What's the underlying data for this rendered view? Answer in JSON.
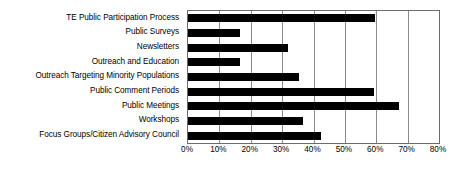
{
  "chart_data": {
    "type": "bar",
    "orientation": "horizontal",
    "title": "",
    "xlabel": "",
    "ylabel": "",
    "xlim": [
      0,
      80
    ],
    "xticks": [
      "0%",
      "10%",
      "20%",
      "30%",
      "40%",
      "50%",
      "60%",
      "70%",
      "80%"
    ],
    "xtick_values": [
      0,
      10,
      20,
      30,
      40,
      50,
      60,
      70,
      80
    ],
    "grid": true,
    "legend": false,
    "bar_color": "#000000",
    "categories": [
      "TE Public Participation Process",
      "Public Surveys",
      "Newsletters",
      "Outreach and Education",
      "Outreach Targeting Minority Populations",
      "Public Comment Periods",
      "Public Meetings",
      "Workshops",
      "Focus Groups/Citizen Advisory Council"
    ],
    "values": [
      59.6,
      16.6,
      31.9,
      16.6,
      35.4,
      59.3,
      67.3,
      36.7,
      42.4
    ]
  }
}
